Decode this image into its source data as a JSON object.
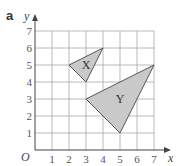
{
  "chart_data": {
    "type": "scatter",
    "title": "",
    "part_label": "a",
    "xlabel": "x",
    "ylabel": "y",
    "origin_label": "O",
    "xlim": [
      0,
      7
    ],
    "ylim": [
      0,
      7
    ],
    "x_ticks": [
      "1",
      "2",
      "3",
      "4",
      "5",
      "6",
      "7"
    ],
    "y_ticks": [
      "1",
      "2",
      "3",
      "4",
      "5",
      "6",
      "7"
    ],
    "grid": true,
    "shapes": [
      {
        "name": "X",
        "vertices": [
          [
            2,
            5
          ],
          [
            4,
            6
          ],
          [
            3,
            4
          ]
        ],
        "label_at": [
          3,
          5
        ]
      },
      {
        "name": "Y",
        "vertices": [
          [
            3,
            3
          ],
          [
            7,
            5
          ],
          [
            5,
            1
          ]
        ],
        "label_at": [
          5,
          3
        ]
      }
    ],
    "colors": {
      "fill": "#c9c9c9",
      "grid": "#a8a8a8",
      "axis": "#444444"
    }
  }
}
